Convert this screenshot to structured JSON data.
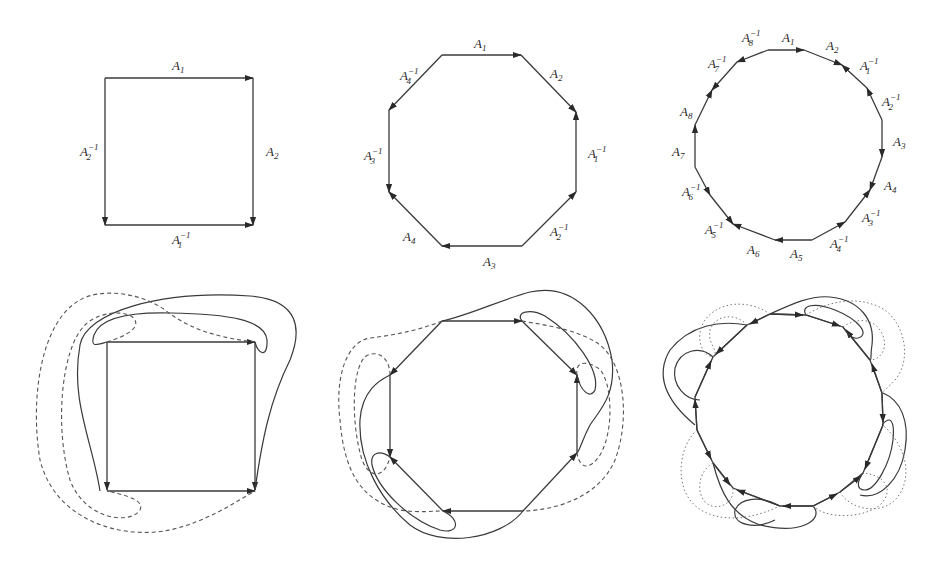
{
  "figure": {
    "colors": {
      "line": "#3a3a3a",
      "background": "#ffffff"
    },
    "top_row": [
      {
        "id": "square",
        "sides": 4,
        "edge_labels": [
          "A1",
          "A2",
          "A1^-1",
          "A2^-1"
        ],
        "labels": {
          "top": {
            "base": "A",
            "sub": "1",
            "sup": ""
          },
          "right": {
            "base": "A",
            "sub": "2",
            "sup": ""
          },
          "bottom": {
            "base": "A",
            "sub": "1",
            "sup": "−1"
          },
          "left": {
            "base": "A",
            "sub": "2",
            "sup": "−1"
          }
        }
      },
      {
        "id": "octagon",
        "sides": 8,
        "edge_labels": [
          "A1",
          "A2",
          "A1^-1",
          "A2^-1",
          "A3",
          "A4",
          "A3^-1",
          "A4^-1"
        ],
        "labels": [
          {
            "base": "A",
            "sub": "1",
            "sup": ""
          },
          {
            "base": "A",
            "sub": "2",
            "sup": ""
          },
          {
            "base": "A",
            "sub": "1",
            "sup": "−1"
          },
          {
            "base": "A",
            "sub": "2",
            "sup": "−1"
          },
          {
            "base": "A",
            "sub": "3",
            "sup": ""
          },
          {
            "base": "A",
            "sub": "4",
            "sup": ""
          },
          {
            "base": "A",
            "sub": "3",
            "sup": "−1"
          },
          {
            "base": "A",
            "sub": "4",
            "sup": "−1"
          }
        ]
      },
      {
        "id": "sixteen-gon",
        "sides": 16,
        "edge_labels": [
          "A1",
          "A2",
          "A1^-1",
          "A2^-1",
          "A3",
          "A4",
          "A3^-1",
          "A4^-1",
          "A5",
          "A6",
          "A5^-1",
          "A6^-1",
          "A7",
          "A8",
          "A7^-1",
          "A8^-1"
        ],
        "labels": [
          {
            "base": "A",
            "sub": "1",
            "sup": ""
          },
          {
            "base": "A",
            "sub": "2",
            "sup": ""
          },
          {
            "base": "A",
            "sub": "1",
            "sup": "−1"
          },
          {
            "base": "A",
            "sub": "2",
            "sup": "−1"
          },
          {
            "base": "A",
            "sub": "3",
            "sup": ""
          },
          {
            "base": "A",
            "sub": "4",
            "sup": ""
          },
          {
            "base": "A",
            "sub": "3",
            "sup": "−1"
          },
          {
            "base": "A",
            "sub": "4",
            "sup": "−1"
          },
          {
            "base": "A",
            "sub": "5",
            "sup": ""
          },
          {
            "base": "A",
            "sub": "6",
            "sup": ""
          },
          {
            "base": "A",
            "sub": "5",
            "sup": "−1"
          },
          {
            "base": "A",
            "sub": "6",
            "sup": "−1"
          },
          {
            "base": "A",
            "sub": "7",
            "sup": ""
          },
          {
            "base": "A",
            "sub": "8",
            "sup": ""
          },
          {
            "base": "A",
            "sub": "7",
            "sup": "−1"
          },
          {
            "base": "A",
            "sub": "8",
            "sup": "−1"
          }
        ]
      }
    ],
    "bottom_row": [
      {
        "id": "square-curves",
        "curve_styles": [
          "solid",
          "dashed"
        ]
      },
      {
        "id": "octagon-curves",
        "curve_styles": [
          "solid",
          "dashed"
        ]
      },
      {
        "id": "sixteen-gon-curves",
        "curve_styles": [
          "solid",
          "dotted"
        ]
      }
    ]
  }
}
